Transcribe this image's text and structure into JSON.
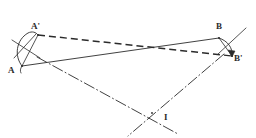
{
  "figure": {
    "type": "geometry-diagram",
    "width": 256,
    "height": 138,
    "background_color": "#ffffff",
    "ink_color": "#2b2b2b"
  },
  "labels": {
    "a": "A",
    "a_prime": "A'",
    "b": "B",
    "b_prime": "B'",
    "i": "I"
  },
  "points": {
    "A": {
      "name": "A",
      "x": 22,
      "y": 66
    },
    "A_prime": {
      "name": "A'",
      "x": 38,
      "y": 35
    },
    "B": {
      "name": "B",
      "x": 219,
      "y": 38
    },
    "B_prime": {
      "name": "B'",
      "x": 232,
      "y": 56
    },
    "I": {
      "name": "I",
      "x": 152,
      "y": 113
    }
  },
  "label_positions": {
    "A": {
      "x": 8,
      "y": 66
    },
    "A_prime": {
      "x": 31,
      "y": 22
    },
    "B": {
      "x": 216,
      "y": 22
    },
    "B_prime": {
      "x": 234,
      "y": 54
    },
    "I": {
      "x": 164,
      "y": 113
    }
  },
  "segments": {
    "ab": {
      "name": "segment-AB",
      "style": "solid",
      "from": "A",
      "to": "B"
    },
    "a_prime_b_prime": {
      "name": "segment-A'B'",
      "style": "dashed",
      "from": "A'",
      "to": "B'"
    },
    "bisector_a": {
      "name": "perpendicular-bisector-AA'",
      "style": "dash-dot",
      "through": "I"
    },
    "bisector_b": {
      "name": "perpendicular-bisector-BB'",
      "style": "dash-dot",
      "through": "I"
    }
  },
  "arcs": {
    "arc_a": {
      "name": "rotation-arc-A-to-A'",
      "from": "A",
      "to": "A'"
    },
    "arc_b": {
      "name": "rotation-arc-B-to-B'",
      "from": "B",
      "to": "B'",
      "arrowhead": true
    }
  },
  "construction_marks": {
    "near_a": "compass-cross-marks",
    "near_b": "compass-cross-marks"
  }
}
